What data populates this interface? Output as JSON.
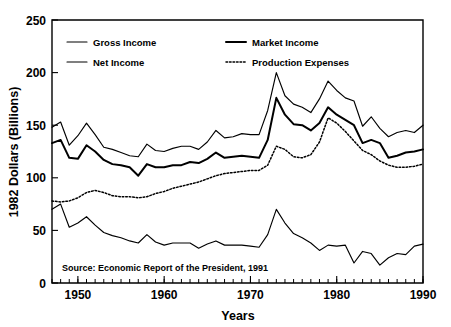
{
  "chart_data": {
    "type": "line",
    "title": "",
    "xlabel": "Years",
    "ylabel": "1982 Dollars  (Billions)",
    "xlim": [
      1947,
      1990
    ],
    "ylim": [
      0,
      250
    ],
    "yticks": [
      0,
      50,
      100,
      150,
      200,
      250
    ],
    "ytick_labels": [
      "0",
      "50",
      "100",
      "150",
      "200",
      "250"
    ],
    "xticks": [
      1950,
      1960,
      1970,
      1980,
      1990
    ],
    "xtick_labels": [
      "1950",
      "1960",
      "1970",
      "1980",
      "1990"
    ],
    "minor_xtick_interval": 1,
    "grid": false,
    "legend_position": "upper-left-inside",
    "annotation": "Source: Economic Report of the President, 1991",
    "x": [
      1947,
      1948,
      1949,
      1950,
      1951,
      1952,
      1953,
      1954,
      1955,
      1956,
      1957,
      1958,
      1959,
      1960,
      1961,
      1962,
      1963,
      1964,
      1965,
      1966,
      1967,
      1968,
      1969,
      1970,
      1971,
      1972,
      1973,
      1974,
      1975,
      1976,
      1977,
      1978,
      1979,
      1980,
      1981,
      1982,
      1983,
      1984,
      1985,
      1986,
      1987,
      1988,
      1989,
      1990
    ],
    "series": [
      {
        "name": "Gross Income",
        "style": "solid-thin",
        "values": [
          148,
          153,
          131,
          140,
          152,
          141,
          129,
          127,
          124,
          121,
          120,
          132,
          126,
          125,
          128,
          130,
          130,
          127,
          134,
          145,
          138,
          139,
          142,
          141,
          141,
          164,
          200,
          178,
          170,
          167,
          162,
          175,
          192,
          183,
          176,
          173,
          149,
          158,
          147,
          139,
          143,
          145,
          143,
          150
        ]
      },
      {
        "name": "Market Income",
        "style": "solid-thick",
        "values": [
          133,
          136,
          119,
          118,
          131,
          125,
          117,
          113,
          112,
          110,
          102,
          113,
          110,
          110,
          112,
          112,
          115,
          114,
          118,
          124,
          119,
          120,
          121,
          120,
          119,
          136,
          176,
          160,
          151,
          150,
          145,
          152,
          167,
          160,
          155,
          150,
          133,
          136,
          133,
          119,
          121,
          124,
          125,
          127
        ]
      },
      {
        "name": "Net Income",
        "style": "solid-thin",
        "values": [
          70,
          75,
          53,
          57,
          63,
          55,
          48,
          45,
          43,
          40,
          38,
          46,
          39,
          36,
          38,
          38,
          38,
          33,
          37,
          40,
          36,
          36,
          36,
          35,
          34,
          46,
          70,
          57,
          47,
          43,
          38,
          31,
          36,
          35,
          36,
          19,
          30,
          28,
          17,
          24,
          28,
          27,
          35,
          37
        ]
      },
      {
        "name": "Production Expenses",
        "style": "dotted",
        "values": [
          78,
          77,
          78,
          81,
          86,
          88,
          86,
          83,
          82,
          82,
          81,
          82,
          85,
          87,
          90,
          92,
          94,
          96,
          99,
          102,
          104,
          105,
          106,
          107,
          107,
          112,
          130,
          127,
          120,
          119,
          122,
          134,
          157,
          152,
          144,
          135,
          126,
          122,
          116,
          112,
          110,
          110,
          111,
          113
        ]
      }
    ]
  },
  "legend": {
    "entries": [
      {
        "label": "Gross Income",
        "style": "solid-thin"
      },
      {
        "label": "Market Income",
        "style": "solid-thick"
      },
      {
        "label": "Net Income",
        "style": "solid-thin"
      },
      {
        "label": "Production Expenses",
        "style": "dotted"
      }
    ]
  },
  "colors": {
    "ink": "#000000",
    "background": "#ffffff"
  }
}
